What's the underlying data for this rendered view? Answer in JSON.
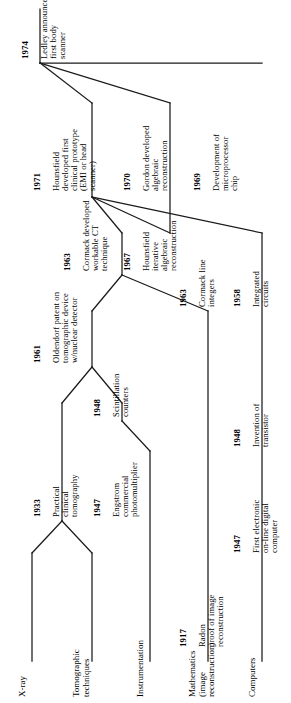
{
  "diagram": {
    "orientation": "rotated-90",
    "stroke_color": "#1a1a1a",
    "background_color": "#ffffff",
    "tracks": [
      {
        "id": "x-ray",
        "label": "X-ray"
      },
      {
        "id": "tomographic-techniques",
        "label": "Tomographic\ntechniques"
      },
      {
        "id": "instrumentation",
        "label": "Instrumentation"
      },
      {
        "id": "mathematics",
        "label": "Mathematics\n(image\nreconstruction)"
      },
      {
        "id": "computers",
        "label": "Computers"
      }
    ],
    "events": [
      {
        "id": "e1933",
        "year": "1933",
        "text": "Practical\nclinical\ntomography"
      },
      {
        "id": "e1947-engstrom",
        "year": "1947",
        "text": "Engstrom\ncommercial\nphotomultiplier"
      },
      {
        "id": "e1917-radon",
        "year": "1917",
        "text": "Radon\nproof of image\nreconstruction"
      },
      {
        "id": "e1947-computer",
        "year": "1947",
        "text": "First electronic\non-line digital\ncomputer"
      },
      {
        "id": "e1948-scintillation",
        "year": "1948",
        "text": "Scintillation\ncounters"
      },
      {
        "id": "e1948-transistor",
        "year": "1948",
        "text": "Invention of\ntransistor"
      },
      {
        "id": "e1961-oldendorf",
        "year": "1961",
        "text": "Oldendorf patent on\ntomographic device\nw/nuclear detector"
      },
      {
        "id": "e1963-cormack-ct",
        "year": "1963",
        "text": "Cormack developed\nworkable CT\ntechnique"
      },
      {
        "id": "e1963-cormack-line",
        "year": "1963",
        "text": "Cormack line\nintegers"
      },
      {
        "id": "e1958-ic",
        "year": "1958",
        "text": "Integrated\ncircuits"
      },
      {
        "id": "e1967-hounsfield",
        "year": "1967",
        "text": "Hounsfield\niterative\nalgebraic\nreconstruction"
      },
      {
        "id": "e1970-gordon",
        "year": "1970",
        "text": "Gordon developed\nalgebraic\nreconstruction"
      },
      {
        "id": "e1969-micro",
        "year": "1969",
        "text": "Development of\nmicroprocessor\nchip"
      },
      {
        "id": "e1971-hounsfield",
        "year": "1971",
        "text": "Hounsfield\ndeveloped first\nclinical prototype\n(EMI or head\nscanner)"
      },
      {
        "id": "e1974-ledley",
        "year": "1974",
        "text": "Ledley announced\nfirst body\nscanner"
      }
    ]
  }
}
